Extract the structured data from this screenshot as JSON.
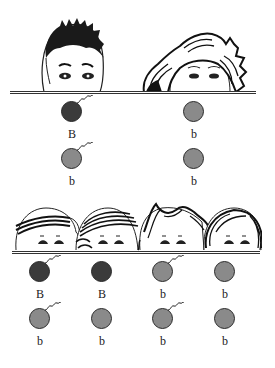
{
  "colors": {
    "dominant": "#3b3b3b",
    "recessive": "#8a8a8a",
    "outline": "#2a2a2a",
    "background": "#ffffff"
  },
  "parents": {
    "figures": [
      {
        "name": "father",
        "hair": "short-spiky-dark"
      },
      {
        "name": "mother",
        "hair": "wavy-striped"
      }
    ],
    "gametes": [
      {
        "col": 0,
        "row": 0,
        "allele": "B",
        "type": "dominant",
        "tail": true
      },
      {
        "col": 1,
        "row": 0,
        "allele": "b",
        "type": "recessive",
        "tail": false
      },
      {
        "col": 0,
        "row": 1,
        "allele": "b",
        "type": "recessive",
        "tail": true
      },
      {
        "col": 1,
        "row": 1,
        "allele": "b",
        "type": "recessive",
        "tail": false
      }
    ]
  },
  "children": {
    "figures": [
      {
        "name": "child-1",
        "hair": "striped-band"
      },
      {
        "name": "child-2",
        "hair": "striped-band"
      },
      {
        "name": "child-3",
        "hair": "wavy"
      },
      {
        "name": "child-4",
        "hair": "long-striped"
      }
    ],
    "gametes": [
      {
        "col": 0,
        "row": 0,
        "allele": "B",
        "type": "dominant",
        "tail": true
      },
      {
        "col": 1,
        "row": 0,
        "allele": "B",
        "type": "dominant",
        "tail": false
      },
      {
        "col": 2,
        "row": 0,
        "allele": "b",
        "type": "recessive",
        "tail": true
      },
      {
        "col": 3,
        "row": 0,
        "allele": "b",
        "type": "recessive",
        "tail": false
      },
      {
        "col": 0,
        "row": 1,
        "allele": "b",
        "type": "recessive",
        "tail": true
      },
      {
        "col": 1,
        "row": 1,
        "allele": "b",
        "type": "recessive",
        "tail": false
      },
      {
        "col": 2,
        "row": 1,
        "allele": "b",
        "type": "recessive",
        "tail": true
      },
      {
        "col": 3,
        "row": 1,
        "allele": "b",
        "type": "recessive",
        "tail": false
      }
    ]
  }
}
